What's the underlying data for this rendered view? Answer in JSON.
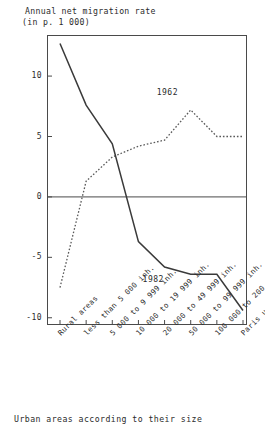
{
  "title": {
    "line1": "Annual net migration rate",
    "line2": "(in p. 1 000)"
  },
  "caption": "Urban areas according to their size",
  "axis": {
    "y_ticks": [
      "10",
      "5",
      "0",
      "-5",
      "-10"
    ],
    "y_tick_values": [
      10,
      5,
      0,
      -5,
      -10
    ]
  },
  "series_labels": {
    "s1962": "1962",
    "s1982": "1982"
  },
  "chart_data": {
    "type": "line",
    "title": "Annual net migration rate (in p. 1 000)",
    "subtitle": "",
    "xlabel": "Urban areas according to their size",
    "ylabel": "Annual net migration rate (in p. 1 000)",
    "categories": [
      "Rural areas",
      "less than 5 000 inh.",
      "5 000 to 9 999 inh.",
      "10 000 to 19 999 inh.",
      "20 000 to 49 999 inh.",
      "50 000 to 99 999 inh.",
      "100 000 to 200 000 inh.",
      "Paris urban area"
    ],
    "series": [
      {
        "name": "1962",
        "style": "dotted",
        "values": [
          -7.5,
          1.3,
          3.3,
          4.2,
          4.7,
          7.2,
          5.0,
          5.0
        ]
      },
      {
        "name": "1982",
        "style": "solid",
        "values": [
          12.7,
          7.6,
          4.4,
          -3.7,
          -5.8,
          -6.4,
          -6.4,
          -9.4
        ]
      }
    ],
    "ylim": [
      -10.6,
      13.4
    ],
    "y_ticks": [
      10,
      5,
      0,
      -5,
      -10
    ],
    "grid": false,
    "zero_line": true,
    "legend": "inline-annotations",
    "annotations": [
      {
        "text": "1962",
        "x_category": "50 000 to 99 999 inh.",
        "y": 8.6
      },
      {
        "text": "1982",
        "x_category": "20 000 to 49 999 inh.",
        "y": -6.9
      }
    ]
  }
}
